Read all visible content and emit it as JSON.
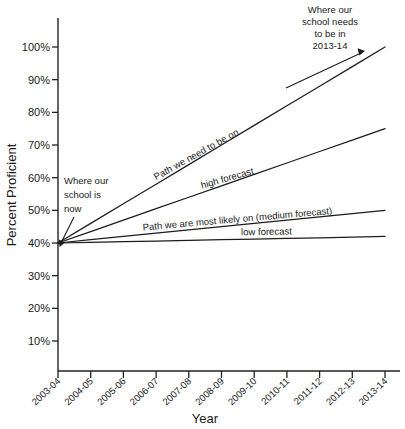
{
  "chart_data": {
    "type": "line",
    "title": "",
    "xlabel": "Year",
    "ylabel": "Percent Proficient",
    "grid": false,
    "legend_position": "inline-labels",
    "x": [
      "2003-04",
      "2004-05",
      "2005-06",
      "2006-07",
      "2007-08",
      "2008-09",
      "2009-10",
      "2010-11",
      "2011-12",
      "2012-13",
      "2013-14"
    ],
    "ylim": [
      0,
      105
    ],
    "yticks": [
      10,
      20,
      30,
      40,
      50,
      60,
      70,
      80,
      90,
      100
    ],
    "ytick_labels": [
      "10%",
      "20%",
      "30%",
      "40%",
      "50%",
      "60%",
      "70%",
      "80%",
      "90%",
      "100%"
    ],
    "series": [
      {
        "name": "Path we need to be on",
        "label": "Path we need to be on",
        "values": [
          40,
          46,
          52,
          58,
          64,
          70,
          76,
          82,
          88,
          94,
          100
        ]
      },
      {
        "name": "high forecast",
        "label": "high forecast",
        "values": [
          40,
          43.5,
          47,
          50.5,
          54,
          57.5,
          61,
          64.5,
          68,
          71.5,
          75
        ]
      },
      {
        "name": "Path we are most likely on (medium forecast)",
        "label": "Path we are most likely on (medium forecast)",
        "values": [
          40,
          41,
          42,
          43,
          44,
          45,
          46,
          47,
          48,
          49,
          50
        ]
      },
      {
        "name": "low forecast",
        "label": "low forecast",
        "values": [
          40,
          40.2,
          40.4,
          40.6,
          40.8,
          41,
          41.2,
          41.4,
          41.6,
          41.8,
          42
        ]
      }
    ],
    "annotations": [
      {
        "id": "where-school-is-now",
        "lines": [
          "Where  our",
          "school is",
          "now"
        ],
        "points_to": {
          "x": "2003-04",
          "y": 40
        }
      },
      {
        "id": "where-school-needs-to-be",
        "lines": [
          "Where our",
          "school needs",
          "to be in",
          "2013-14"
        ],
        "points_to": {
          "x": "2013-14",
          "y": 100
        }
      }
    ],
    "colors": {
      "axis": "#222222",
      "series": "#1c1c1c",
      "text": "#1a1a1a",
      "background": "#ffffff"
    }
  }
}
